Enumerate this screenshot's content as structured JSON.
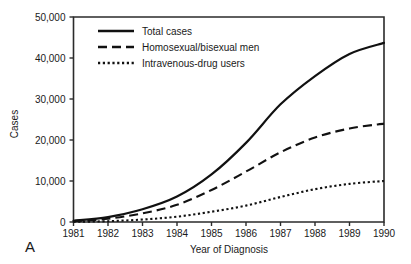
{
  "panel": {
    "label": "A"
  },
  "chart_data": {
    "type": "line",
    "title": "",
    "subtitle": "",
    "xlabel": "Year of Diagnosis",
    "ylabel": "Cases",
    "x": [
      1981,
      1982,
      1983,
      1984,
      1985,
      1986,
      1987,
      1988,
      1989,
      1990
    ],
    "categories": [
      "1981",
      "1982",
      "1983",
      "1984",
      "1985",
      "1986",
      "1987",
      "1988",
      "1989",
      "1990"
    ],
    "xtick_labels": [
      "1981",
      "1982",
      "1983",
      "1984",
      "1985",
      "1986",
      "1987",
      "1988",
      "1989",
      "1990"
    ],
    "ytick_labels": [
      "0",
      "10,000",
      "20,000",
      "30,000",
      "40,000",
      "50,000"
    ],
    "ytick_values": [
      0,
      10000,
      20000,
      30000,
      40000,
      50000
    ],
    "xlim": [
      1981,
      1990
    ],
    "ylim": [
      0,
      50000
    ],
    "grid": false,
    "legend_position": "top-left-inside",
    "series": [
      {
        "name": "Total cases",
        "style": "solid",
        "values": [
          300,
          1200,
          3100,
          6200,
          11600,
          19300,
          28700,
          35600,
          41000,
          43700
        ]
      },
      {
        "name": "Homosexual/bisexual men",
        "style": "dashed",
        "values": [
          200,
          800,
          2100,
          4200,
          7800,
          12300,
          17000,
          20600,
          22800,
          24000
        ]
      },
      {
        "name": "Intravenous-drug users",
        "style": "dotted",
        "values": [
          40,
          200,
          600,
          1300,
          2500,
          4000,
          6100,
          8000,
          9300,
          10000
        ]
      }
    ],
    "legend": [
      {
        "label": "Total cases",
        "style": "solid"
      },
      {
        "label": "Homosexual/bisexual men",
        "style": "dashed"
      },
      {
        "label": "Intravenous-drug users",
        "style": "dotted"
      }
    ],
    "colors": {
      "line": "#111111",
      "axis": "#2b2b2b",
      "background": "#ffffff",
      "text": "#1a1a1a"
    }
  }
}
